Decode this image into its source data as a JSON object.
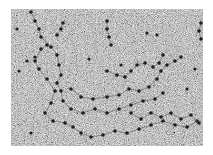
{
  "image": {
    "description": "Grayscale electron micrograph showing beaded filament strands (nucleosome-like beads on a string) on a noisy granular background",
    "background_color": "#8a8a8a",
    "bead_color": "#1e1e1e",
    "strands": [
      [
        [
          20,
          3
        ],
        [
          24,
          12
        ],
        [
          28,
          20
        ],
        [
          30,
          28
        ],
        [
          40,
          38
        ],
        [
          46,
          46
        ],
        [
          48,
          56
        ],
        [
          50,
          66
        ],
        [
          46,
          74
        ],
        [
          50,
          82
        ],
        [
          52,
          92
        ],
        [
          60,
          100
        ],
        [
          72,
          104
        ],
        [
          84,
          100
        ],
        [
          96,
          104
        ],
        [
          108,
          100
        ],
        [
          120,
          96
        ],
        [
          132,
          92
        ],
        [
          144,
          90
        ],
        [
          152,
          84
        ]
      ],
      [
        [
          36,
          36
        ],
        [
          30,
          40
        ],
        [
          24,
          52
        ],
        [
          28,
          60
        ],
        [
          36,
          70
        ],
        [
          44,
          82
        ],
        [
          40,
          94
        ],
        [
          34,
          104
        ],
        [
          42,
          112
        ],
        [
          54,
          114
        ],
        [
          62,
          118
        ],
        [
          70,
          124
        ],
        [
          80,
          128
        ],
        [
          92,
          126
        ],
        [
          104,
          122
        ],
        [
          116,
          124
        ],
        [
          128,
          120
        ],
        [
          140,
          116
        ],
        [
          152,
          112
        ],
        [
          164,
          116
        ],
        [
          176,
          118
        ],
        [
          186,
          112
        ]
      ],
      [
        [
          60,
          80
        ],
        [
          70,
          88
        ],
        [
          82,
          90
        ],
        [
          96,
          88
        ],
        [
          108,
          86
        ],
        [
          118,
          80
        ],
        [
          128,
          82
        ],
        [
          138,
          78
        ],
        [
          146,
          70
        ],
        [
          150,
          62
        ],
        [
          156,
          56
        ],
        [
          164,
          52
        ],
        [
          170,
          48
        ]
      ],
      [
        [
          96,
          62
        ],
        [
          106,
          66
        ],
        [
          114,
          68
        ],
        [
          120,
          62
        ],
        [
          126,
          56
        ],
        [
          134,
          54
        ],
        [
          142,
          58
        ],
        [
          148,
          54
        ],
        [
          152,
          46
        ]
      ],
      [
        [
          96,
          12
        ],
        [
          96,
          20
        ],
        [
          98,
          28
        ],
        [
          100,
          36
        ]
      ],
      [
        [
          52,
          14
        ],
        [
          50,
          20
        ],
        [
          46,
          26
        ]
      ],
      [
        [
          120,
          104
        ],
        [
          130,
          110
        ],
        [
          140,
          104
        ],
        [
          150,
          108
        ],
        [
          160,
          104
        ],
        [
          170,
          110
        ],
        [
          180,
          106
        ],
        [
          188,
          114
        ]
      ],
      [
        [
          190,
          14
        ],
        [
          188,
          22
        ],
        [
          190,
          30
        ]
      ]
    ],
    "loose_beads": [
      [
        8,
        62
      ],
      [
        16,
        52
      ],
      [
        24,
        48
      ],
      [
        78,
        50
      ],
      [
        146,
        26
      ],
      [
        136,
        24
      ],
      [
        176,
        80
      ],
      [
        20,
        124
      ],
      [
        184,
        60
      ],
      [
        110,
        56
      ],
      [
        6,
        20
      ]
    ]
  }
}
